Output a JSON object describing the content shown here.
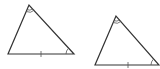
{
  "diagram": {
    "stroke_color": "#333333",
    "mark_color": "#555555",
    "background": "#ffffff",
    "triangles": [
      {
        "id": "triangle-1",
        "vertices": {
          "apex": [
            29,
            5
          ],
          "bottom_left": [
            8,
            54
          ],
          "bottom_right": [
            74,
            54
          ]
        },
        "marks": {
          "apex_angle": "double-arc",
          "bottom_right_angle": "single-arc",
          "base_side": "single-tick"
        }
      },
      {
        "id": "triangle-2",
        "vertices": {
          "apex": [
            116,
            16
          ],
          "bottom_left": [
            95,
            65
          ],
          "bottom_right": [
            159,
            65
          ]
        },
        "marks": {
          "apex_angle": "double-arc",
          "bottom_right_angle": "single-arc",
          "base_side": "single-tick"
        }
      }
    ]
  }
}
